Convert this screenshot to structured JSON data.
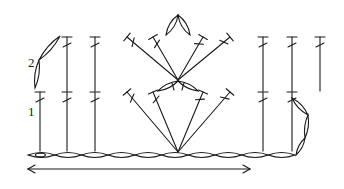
{
  "diagram": {
    "type": "crochet-stitch-chart",
    "ink_color": "#1a1a1a",
    "background": "#ffffff",
    "row_labels": [
      {
        "text": "2",
        "x": 28,
        "y": 56
      },
      {
        "text": "1",
        "x": 28,
        "y": 105
      }
    ],
    "foundation_chain": {
      "y": 155,
      "x_start": 28,
      "x_end": 295,
      "count": 10,
      "start_marker": "slip-knot"
    },
    "direction_arrow": {
      "y": 169,
      "x_start": 28,
      "x_end": 250,
      "heads": "both"
    },
    "row1": {
      "top_y": 92,
      "vertical_stitches_x": [
        40,
        67,
        95,
        263,
        292
      ],
      "fan_base": {
        "x": 178,
        "y": 152
      },
      "fan_tops_x": [
        127,
        153,
        203,
        230
      ],
      "stitch": "double-crochet"
    },
    "cluster_petals": {
      "apex": {
        "x": 178,
        "y": 81
      },
      "count": 2
    },
    "row2": {
      "top_y": 37,
      "vertical_stitches_x": [
        67,
        95,
        263,
        292,
        320
      ],
      "fan_base": {
        "x": 178,
        "y": 80
      },
      "fan_tops_x": [
        127,
        153,
        203,
        230
      ],
      "stitch": "double-crochet"
    },
    "top_petals": {
      "apex": {
        "x": 178,
        "y": 15
      },
      "count": 2
    },
    "turning_chain_left": {
      "from": {
        "x": 35,
        "y": 88
      },
      "to": {
        "x": 60,
        "y": 36
      },
      "count": 2
    },
    "turning_chain_right": {
      "from": {
        "x": 296,
        "y": 155
      },
      "to": {
        "x": 302,
        "y": 98
      },
      "count": 3
    }
  }
}
